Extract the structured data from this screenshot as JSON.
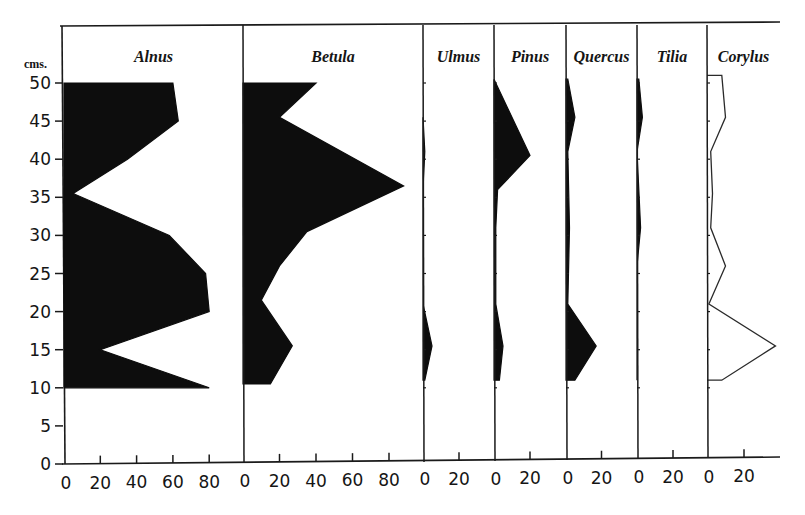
{
  "chart_data": {
    "type": "area",
    "title": "",
    "ylabel": "cms.",
    "xlabel": "",
    "y_ticks": [
      0,
      5,
      10,
      15,
      20,
      25,
      30,
      35,
      40,
      45,
      50
    ],
    "ylim": [
      0,
      50
    ],
    "grid": false,
    "legend": "none",
    "panels": [
      {
        "name": "Alnus",
        "style": "filled",
        "xlim": [
          0,
          80
        ],
        "x_ticks": [
          0,
          20,
          40,
          60,
          80
        ],
        "points": [
          [
            50,
            60
          ],
          [
            45,
            63
          ],
          [
            40,
            35
          ],
          [
            35.5,
            5
          ],
          [
            30,
            58
          ],
          [
            25,
            78
          ],
          [
            20,
            80
          ],
          [
            15,
            20
          ],
          [
            10,
            80
          ]
        ]
      },
      {
        "name": "Betula",
        "style": "filled",
        "xlim": [
          0,
          80
        ],
        "x_ticks": [
          0,
          20,
          40,
          60,
          80
        ],
        "points": [
          [
            50,
            40
          ],
          [
            45.5,
            20
          ],
          [
            36.5,
            88
          ],
          [
            30.5,
            35
          ],
          [
            26,
            20
          ],
          [
            21.5,
            10
          ],
          [
            15.5,
            27
          ],
          [
            10.5,
            15
          ]
        ]
      },
      {
        "name": "Ulmus",
        "style": "filled",
        "xlim": [
          0,
          20
        ],
        "x_ticks": [
          0,
          20
        ],
        "points": [
          [
            45.5,
            0
          ],
          [
            41,
            1
          ],
          [
            36,
            0
          ],
          [
            21,
            0
          ],
          [
            15.5,
            5
          ],
          [
            11,
            1
          ]
        ]
      },
      {
        "name": "Pinus",
        "style": "filled",
        "xlim": [
          0,
          20
        ],
        "x_ticks": [
          0,
          20
        ],
        "points": [
          [
            50.5,
            0
          ],
          [
            40.5,
            20
          ],
          [
            36,
            2
          ],
          [
            31,
            1
          ],
          [
            21,
            1
          ],
          [
            15.5,
            5
          ],
          [
            11,
            3
          ]
        ]
      },
      {
        "name": "Quercus",
        "style": "filled",
        "xlim": [
          0,
          20
        ],
        "x_ticks": [
          0,
          20
        ],
        "points": [
          [
            50.5,
            1
          ],
          [
            45.5,
            5
          ],
          [
            41,
            1
          ],
          [
            31,
            2
          ],
          [
            21,
            1
          ],
          [
            15.5,
            17
          ],
          [
            11,
            5
          ]
        ]
      },
      {
        "name": "Tilia",
        "style": "filled",
        "xlim": [
          0,
          20
        ],
        "x_ticks": [
          0,
          20
        ],
        "points": [
          [
            50.5,
            1
          ],
          [
            45.5,
            3
          ],
          [
            41,
            0
          ],
          [
            31,
            2
          ],
          [
            26,
            0
          ],
          [
            11,
            0
          ]
        ]
      },
      {
        "name": "Corylus",
        "style": "outline",
        "xlim": [
          0,
          35
        ],
        "x_ticks": [
          0,
          20
        ],
        "points": [
          [
            51,
            0
          ],
          [
            51,
            8
          ],
          [
            45.5,
            10
          ],
          [
            41,
            2
          ],
          [
            35.5,
            3
          ],
          [
            31,
            2
          ],
          [
            26,
            10
          ],
          [
            21,
            1
          ],
          [
            15.5,
            37
          ],
          [
            11,
            8
          ],
          [
            11,
            0
          ]
        ]
      }
    ]
  }
}
